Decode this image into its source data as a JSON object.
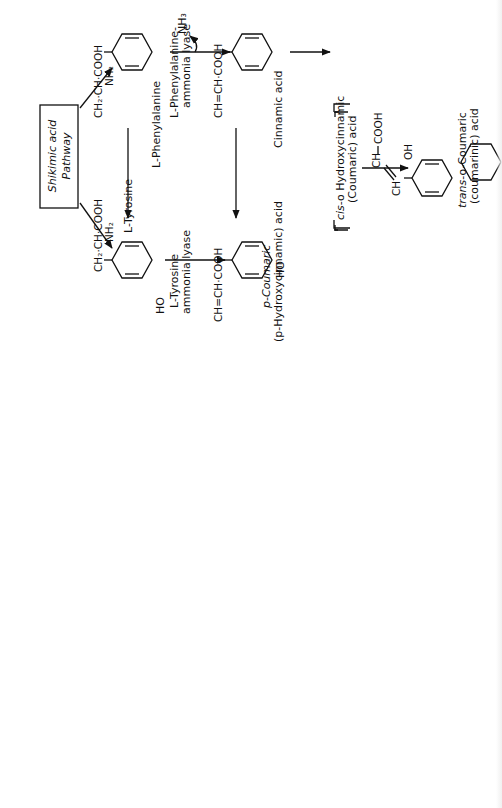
{
  "diagram": {
    "orientation": "rotated -90deg (text reads bottom-to-top)",
    "start_box": {
      "line1": "Shikimic acid",
      "line2": "Pathway"
    },
    "compounds": {
      "phenylalanine": {
        "group": "CH₂·CH·COOH",
        "sub": "NH₂",
        "name": "L-Phenylalanine"
      },
      "tyrosine": {
        "group": "CH₂·CH·COOH",
        "sub": "NH₂",
        "name": "L-Tyrosine",
        "ho": "HO"
      },
      "cinnamic": {
        "group": "CH=CH·COOH",
        "name": "Cinnamic acid"
      },
      "p_coumaric": {
        "group": "CH=CH·COOH",
        "name1": "p-Coumaric",
        "name2": "(p-Hydroxycinnamic) acid",
        "ho": "HO"
      },
      "caffeic": {
        "group": "CH=CH·COOH",
        "name": "Caffeic acid",
        "ho1": "HO",
        "ho2": "HO"
      },
      "ferulic": {
        "group": "CH=CH·COOH",
        "name": "Ferulic acid",
        "meo": "CH₃O",
        "ho": "HO"
      },
      "p_hydroxybenzoic": {
        "group": "COOH",
        "name1": "p-Hydroxybenzoic",
        "name2": "acid",
        "ho": "HO"
      },
      "chorismic": {
        "name1": "Chorismic",
        "name2": "acid"
      },
      "protocatechuic": {
        "group": "COOH",
        "name1": "Protocatechuic",
        "name2": "acid",
        "ho1": "HO",
        "ho2": "HO"
      },
      "vanillic": {
        "group": "COOH",
        "name1": "Vanillic",
        "name2": "acid",
        "meo": "CH₃O",
        "ho": "HO"
      },
      "umbelliferone": {
        "name": "Umbelliferone",
        "ho": "HO",
        "o_ring": "O",
        "o_keto": "O"
      },
      "herniarin": {
        "name": "Herniarin",
        "meo": "CH₃O",
        "o_ring": "O",
        "o_keto": "O"
      },
      "aesculetin": {
        "name": "Aesculetin",
        "ho1": "HO",
        "ho2": "HO",
        "o_ring": "O",
        "o_keto": "O"
      },
      "chlorogenic": {
        "name1": "Chlorogenic",
        "name2": "acid"
      },
      "cis_coumaric": {
        "name1_italic": "cis",
        "name1_rest": "-o Hydroxycinnamic",
        "name2": "(Coumaric) acid"
      },
      "trans_coumaric": {
        "ch1": "CH",
        "ch2": "CH",
        "group": "COOH",
        "oh": "OH",
        "name1_italic": "trans",
        "name1_rest": "-o-Coumaric",
        "name2": "(coumarinic) acid"
      },
      "coumarin": {
        "name": "Coumarin",
        "o_ring": "O",
        "o_keto": "O"
      }
    },
    "enzymes": {
      "pal": {
        "line1": "L-Phenylalanine-",
        "line2": "ammonia lyase",
        "byproduct": "NH₃"
      },
      "tal": {
        "line1": "L-Tyrosine",
        "line2": "ammonia lyase"
      }
    }
  }
}
